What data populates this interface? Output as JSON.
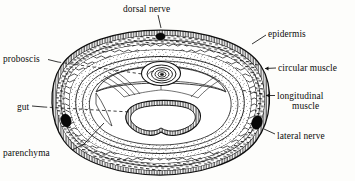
{
  "figure": {
    "organism_structure": "worm-cross-section",
    "ink_color": "#111111",
    "background_color": "#fdfdfb"
  },
  "labels": [
    {
      "id": "dorsal-nerve",
      "text": "dorsal nerve",
      "x": 123,
      "y": 4,
      "align": "left",
      "leader": "solid-short"
    },
    {
      "id": "epidermis",
      "text": "epidermis",
      "x": 268,
      "y": 29,
      "align": "left",
      "leader": "solid-short"
    },
    {
      "id": "circular-muscle",
      "text": "circular muscle",
      "x": 278,
      "y": 63,
      "align": "left",
      "leader": "dash-arrow"
    },
    {
      "id": "longitudinal-muscle",
      "text": "longitudinal",
      "x": 277,
      "y": 91,
      "align": "left",
      "leader": "dash-arrow"
    },
    {
      "id": "longitudinal-muscle-line2",
      "text": "muscle",
      "x": 292,
      "y": 101,
      "align": "left",
      "leader": "none"
    },
    {
      "id": "lateral-nerve",
      "text": "lateral nerve",
      "x": 277,
      "y": 131,
      "align": "left",
      "leader": "solid-short"
    },
    {
      "id": "proboscis",
      "text": "proboscis",
      "x": 3,
      "y": 54,
      "align": "left",
      "leader": "dash-long"
    },
    {
      "id": "gut",
      "text": "gut",
      "x": 17,
      "y": 102,
      "align": "left",
      "leader": "dash-long"
    },
    {
      "id": "parenchyma",
      "text": "parenchyma",
      "x": 3,
      "y": 148,
      "align": "left",
      "leader": "solid-long"
    }
  ],
  "anatomy": {
    "body_wall_layers": [
      "epidermis",
      "circular muscle",
      "longitudinal muscle",
      "parenchyma"
    ],
    "organs": [
      {
        "name": "dorsal nerve",
        "count": 1,
        "appearance": "solid black oval, mid-dorsal"
      },
      {
        "name": "lateral nerve",
        "count": 2,
        "appearance": "solid black oval, left and right"
      },
      {
        "name": "proboscis",
        "count": 1,
        "appearance": "concentric rings, dorsal-central"
      },
      {
        "name": "gut",
        "count": 1,
        "appearance": "rounded triangular lumen with ciliated lining, ventral-central"
      },
      {
        "name": "parenchyma",
        "count": 1,
        "appearance": "stippled filling tissue"
      }
    ]
  }
}
